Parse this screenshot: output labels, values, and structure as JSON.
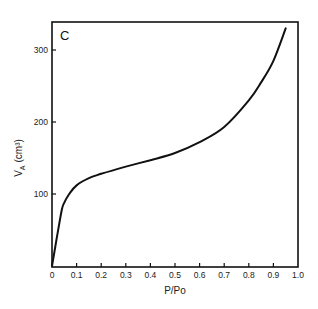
{
  "chart_data": {
    "type": "line",
    "title": "",
    "panel_label": "C",
    "xlabel": "P/Po",
    "ylabel": "V_A (cm³)",
    "ylabel_main": "V",
    "ylabel_sub": "A",
    "ylabel_unit": "(cm³)",
    "xlim": [
      0,
      1.0
    ],
    "ylim": [
      0,
      340
    ],
    "xticks": [
      0,
      0.1,
      0.2,
      0.3,
      0.4,
      0.5,
      0.6,
      0.7,
      0.8,
      0.9,
      1.0
    ],
    "xtick_labels": [
      "0",
      "0.1",
      "0.2",
      "0.3",
      "0.4",
      "0.5",
      "0.6",
      "0.7",
      "0.8",
      "0.9",
      "1.0"
    ],
    "yticks": [
      100,
      200,
      300
    ],
    "ytick_labels": [
      "100",
      "200",
      "300"
    ],
    "grid": false,
    "legend": null,
    "series": [
      {
        "name": "isotherm",
        "x": [
          0,
          0.02,
          0.04,
          0.05,
          0.07,
          0.1,
          0.15,
          0.2,
          0.3,
          0.4,
          0.5,
          0.6,
          0.7,
          0.8,
          0.85,
          0.9,
          0.95
        ],
        "y": [
          0,
          40,
          78,
          88,
          100,
          112,
          122,
          128,
          138,
          147,
          157,
          172,
          193,
          230,
          255,
          285,
          330
        ]
      }
    ]
  },
  "colors": {
    "line": "#111111",
    "axis": "#111111",
    "background": "#ffffff"
  }
}
